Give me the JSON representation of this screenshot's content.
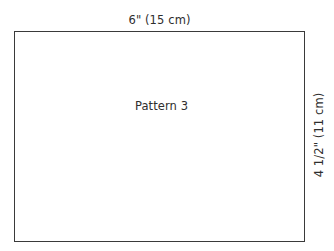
{
  "diagram": {
    "type": "sewing-pattern-rectangle",
    "shape_label": "Pattern 3",
    "dimensions": {
      "width_label": "6\" (15 cm)",
      "height_label": "4 1/2\" (11 cm)",
      "width_inches": "6\"",
      "width_metric": "15 cm",
      "height_inches": "4 1/2\"",
      "height_metric": "11 cm"
    },
    "colors": {
      "background": "#ffffff",
      "shape_fill": "#ffffff",
      "shape_stroke": "#3a3a3a",
      "text": "#2e2e2e"
    }
  }
}
